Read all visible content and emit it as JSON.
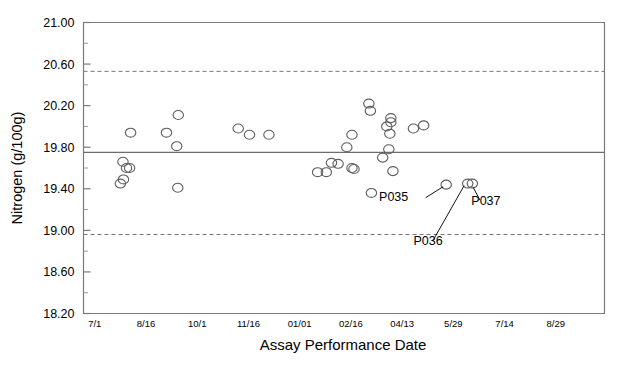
{
  "chart_data": {
    "type": "scatter",
    "title": "",
    "xlabel": "Assay Performance Date",
    "ylabel": "Nitrogen (g/100g)",
    "ylim": [
      18.2,
      21.0
    ],
    "ytick_labels": [
      "21.00",
      "20.60",
      "20.20",
      "19.80",
      "19.40",
      "19.00",
      "18.60",
      "18.20"
    ],
    "ytick_values": [
      21.0,
      20.6,
      20.2,
      19.8,
      19.4,
      19.0,
      18.6,
      18.2
    ],
    "yminor_step": 0.2,
    "xtick_labels": [
      "7/1",
      "8/16",
      "10/1",
      "11/16",
      "01/01",
      "02/16",
      "04/13",
      "5/29",
      "7/14",
      "8/29"
    ],
    "xtick_positions": [
      0,
      1,
      2,
      3,
      4,
      5,
      6,
      7,
      8,
      9
    ],
    "xlim": [
      -0.22,
      9.95
    ],
    "grid": false,
    "legend": null,
    "reference_lines": [
      {
        "name": "upper-control-limit",
        "value": 20.53,
        "style": "dashed"
      },
      {
        "name": "center-line",
        "value": 19.75,
        "style": "solid"
      },
      {
        "name": "lower-control-limit",
        "value": 18.96,
        "style": "dashed"
      }
    ],
    "marker": {
      "shape": "open-circle",
      "radius_px": 5.2,
      "color": "#5d5d5d"
    },
    "points": [
      {
        "x": 0.7,
        "y": 19.94
      },
      {
        "x": 0.55,
        "y": 19.66
      },
      {
        "x": 0.62,
        "y": 19.6
      },
      {
        "x": 0.68,
        "y": 19.6
      },
      {
        "x": 0.56,
        "y": 19.49
      },
      {
        "x": 0.5,
        "y": 19.45
      },
      {
        "x": 1.63,
        "y": 20.11
      },
      {
        "x": 1.6,
        "y": 19.81
      },
      {
        "x": 1.62,
        "y": 19.41
      },
      {
        "x": 1.4,
        "y": 19.94
      },
      {
        "x": 2.8,
        "y": 19.98
      },
      {
        "x": 3.02,
        "y": 19.92
      },
      {
        "x": 3.4,
        "y": 19.92
      },
      {
        "x": 4.52,
        "y": 19.56
      },
      {
        "x": 5.38,
        "y": 20.15
      },
      {
        "x": 5.35,
        "y": 20.22
      },
      {
        "x": 5.02,
        "y": 19.92
      },
      {
        "x": 5.78,
        "y": 20.08
      },
      {
        "x": 5.7,
        "y": 20.0
      },
      {
        "x": 5.78,
        "y": 20.04
      },
      {
        "x": 5.76,
        "y": 19.93
      },
      {
        "x": 6.22,
        "y": 19.98
      },
      {
        "x": 6.42,
        "y": 20.01
      },
      {
        "x": 4.92,
        "y": 19.8
      },
      {
        "x": 5.74,
        "y": 19.78
      },
      {
        "x": 5.62,
        "y": 19.7
      },
      {
        "x": 4.62,
        "y": 19.65
      },
      {
        "x": 4.75,
        "y": 19.64
      },
      {
        "x": 5.02,
        "y": 19.6
      },
      {
        "x": 5.06,
        "y": 19.59
      },
      {
        "x": 5.82,
        "y": 19.57
      },
      {
        "x": 4.35,
        "y": 19.56
      },
      {
        "x": 5.4,
        "y": 19.36
      },
      {
        "x": 6.86,
        "y": 19.44
      },
      {
        "x": 7.28,
        "y": 19.45
      },
      {
        "x": 7.37,
        "y": 19.45
      }
    ],
    "annotations": [
      {
        "name": "P035",
        "text": "P035",
        "label_x": 5.55,
        "label_y": 19.28,
        "leader_from_x": 6.46,
        "leader_from_y": 19.315,
        "leader_to_x": 6.8,
        "leader_to_y": 19.42
      },
      {
        "name": "P036",
        "text": "P036",
        "label_x": 6.22,
        "label_y": 18.86,
        "leader_from_x": 6.6,
        "leader_from_y": 18.9,
        "leader_to_x": 7.21,
        "leader_to_y": 19.43
      },
      {
        "name": "P037",
        "text": "P037",
        "label_x": 7.35,
        "label_y": 19.24,
        "leader_from_x": 7.52,
        "leader_from_y": 19.29,
        "leader_to_x": 7.38,
        "leader_to_y": 19.42
      }
    ]
  },
  "colors": {
    "axis": "#7a7a7a",
    "marker": "#5d5d5d",
    "center_line": "#6e6e6e",
    "control_limit": "#777777",
    "text": "#000000",
    "background": "#ffffff"
  }
}
